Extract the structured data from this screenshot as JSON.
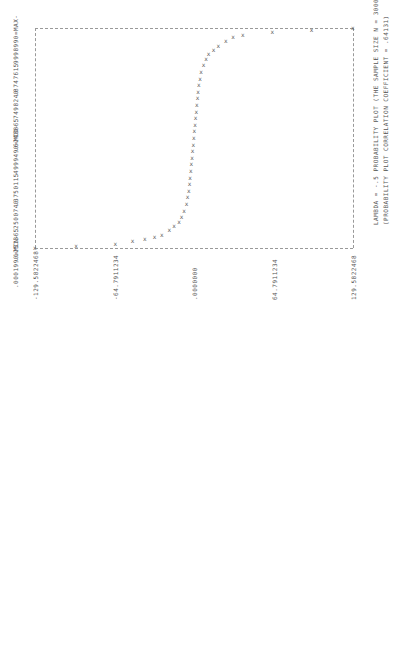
{
  "chart_data": {
    "type": "scatter",
    "title": "LAMBDA = -.5 PROBABILITY PLOT (THE SAMPLE SIZE N = 3000)",
    "subtitle": "(PROBABILITY PLOT CORRELATION COEFFICIENT = .64131)",
    "xlabel": "",
    "ylabel": "",
    "orientation": "rotated 90 degrees counter-clockwise",
    "y_tick_labels": [
      ".9998990=MAX-",
      ".8747615",
      ".7498240",
      ".6248865",
      ".4999490=MID-",
      ".3750115",
      ".2500740",
      ".1251365",
      ".0001990=MIN-"
    ],
    "y_ticks": [
      0.999899,
      0.8747615,
      0.749824,
      0.6248865,
      0.499949,
      0.3750115,
      0.250074,
      0.1251365,
      0.000199
    ],
    "x_tick_labels": [
      "-129.5822468",
      "-64.7911234",
      ".0000000",
      "64.7911234",
      "129.5822468"
    ],
    "x_ticks": [
      -129.5822468,
      -64.7911234,
      0.0,
      64.7911234,
      129.5822468
    ],
    "xlim": [
      -129.5822468,
      129.5822468
    ],
    "ylim": [
      0.000199,
      0.999899
    ],
    "grid": false,
    "marker": "X",
    "x": [
      -129.58,
      -96,
      -64,
      -50,
      -40,
      -32,
      -26,
      -20,
      -16,
      -12,
      -10,
      -8,
      -6,
      -5,
      -4,
      -3.5,
      -3,
      -2.5,
      -2,
      -1.5,
      -1,
      -0.5,
      0,
      0.5,
      1,
      1.5,
      2,
      2.5,
      3,
      3.5,
      4,
      5,
      6,
      8,
      10,
      12,
      16,
      20,
      26,
      32,
      40,
      64,
      96,
      129.58
    ],
    "y": [
      0.0002,
      0.01,
      0.02,
      0.03,
      0.04,
      0.05,
      0.06,
      0.08,
      0.1,
      0.12,
      0.14,
      0.17,
      0.2,
      0.23,
      0.26,
      0.29,
      0.32,
      0.35,
      0.38,
      0.41,
      0.44,
      0.47,
      0.5,
      0.53,
      0.56,
      0.59,
      0.62,
      0.65,
      0.68,
      0.71,
      0.74,
      0.77,
      0.8,
      0.83,
      0.86,
      0.88,
      0.9,
      0.92,
      0.94,
      0.96,
      0.97,
      0.98,
      0.99,
      0.9999
    ]
  },
  "labels": {
    "lambda_line": "LAMBDA = -.5 PROBABILITY PLOT (THE SAMPLE SIZE N = 3000)",
    "ppcc_line": "(PROBABILITY PLOT CORRELATION COEFFICIENT = .64131)"
  }
}
